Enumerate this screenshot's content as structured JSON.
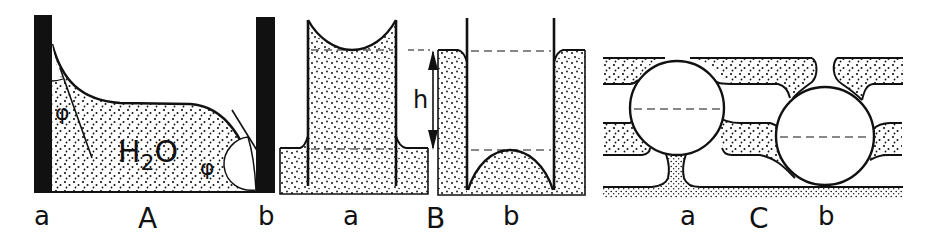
{
  "figure": {
    "type": "capillarity-diagram",
    "ink_color": "#111111",
    "background": "#ffffff",
    "panels": [
      {
        "id": "A",
        "label": "A",
        "sublabels": [
          "a",
          "b"
        ],
        "liquid_label": "H",
        "liquid_subscript": "2",
        "liquid_suffix": "O",
        "angle_symbol_left": "φ",
        "angle_symbol_right": "φ"
      },
      {
        "id": "B",
        "label": "B",
        "sublabels": [
          "a",
          "b"
        ],
        "height_symbol": "h"
      },
      {
        "id": "C",
        "label": "C",
        "sublabels": [
          "a",
          "b"
        ]
      }
    ]
  }
}
